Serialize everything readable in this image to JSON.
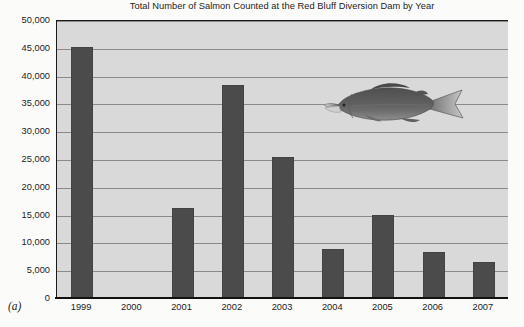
{
  "figure": {
    "panel_label": "(a)"
  },
  "chart_data": {
    "type": "bar",
    "title": "Total Number of Salmon Counted at the Red Bluff Diversion Dam by Year",
    "xlabel": "",
    "ylabel": "",
    "categories": [
      "1999",
      "2000",
      "2001",
      "2002",
      "2003",
      "2004",
      "2005",
      "2006",
      "2007"
    ],
    "values": [
      45300,
      0,
      16400,
      38500,
      25500,
      9000,
      15100,
      8500,
      6600
    ],
    "ylim": [
      0,
      50000
    ],
    "ytick_values": [
      0,
      5000,
      10000,
      15000,
      20000,
      25000,
      30000,
      35000,
      40000,
      45000,
      50000
    ],
    "ytick_labels": [
      "0",
      "5,000",
      "10,000",
      "15,000",
      "20,000",
      "25,000",
      "30,000",
      "35,000",
      "40,000",
      "45,000",
      "50,000"
    ],
    "grid": true,
    "legend": null,
    "bar_color": "#4b4b4b",
    "plot_background": "#d9d9d9",
    "gridline_color": "#8b8b8b",
    "axis_color": "#111111"
  },
  "annotations": {
    "salmon_image": {
      "name": "salmon-illustration",
      "description": "grayscale chinook salmon facing left"
    }
  }
}
